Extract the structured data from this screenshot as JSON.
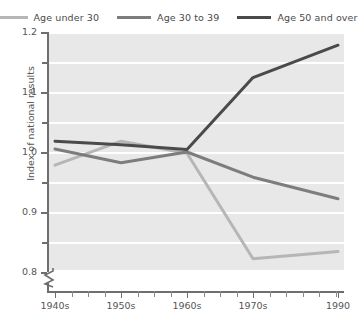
{
  "chart_data": {
    "type": "line",
    "title": "",
    "xlabel": "",
    "ylabel": "Index of national results",
    "x": [
      "1940s",
      "1950s",
      "1960s",
      "1970s",
      "1990"
    ],
    "ylim": [
      0.8,
      1.2
    ],
    "yticks": [
      0.8,
      0.9,
      1.0,
      1.1,
      1.2
    ],
    "yticks_minor": [
      0.85,
      0.95,
      1.05,
      1.15
    ],
    "grid": "horizontal-white",
    "legend_position": "top",
    "axis_break": "y-axis break below 0.8",
    "series": [
      {
        "name": "Age under 30",
        "color": "#b6b6b6",
        "values": [
          0.978,
          1.018,
          0.998,
          0.822,
          0.834
        ]
      },
      {
        "name": "Age 30 to 39",
        "color": "#7d7d7d",
        "values": [
          1.005,
          0.982,
          1.0,
          0.958,
          0.922
        ]
      },
      {
        "name": "Age 50 and over",
        "color": "#4a4a4a",
        "values": [
          1.018,
          1.012,
          1.004,
          1.124,
          1.178
        ]
      }
    ]
  },
  "legend": {
    "items": [
      {
        "label": "Age under 30",
        "color": "#b6b6b6"
      },
      {
        "label": "Age 30 to 39",
        "color": "#7d7d7d"
      },
      {
        "label": "Age 50 and over",
        "color": "#4a4a4a"
      }
    ]
  },
  "axes": {
    "y_title": "Index of national results",
    "y_labels": [
      "1.2",
      "1.1",
      "1.0",
      "0.9",
      "0.8"
    ],
    "x_labels": [
      "1940s",
      "1950s",
      "1960s",
      "1970s",
      "1990"
    ]
  }
}
